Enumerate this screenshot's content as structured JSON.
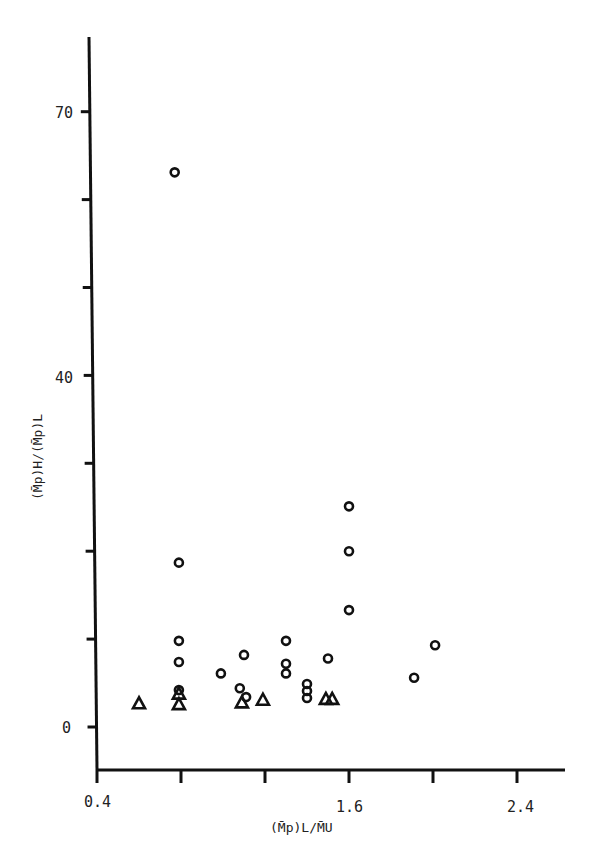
{
  "chart_data": {
    "type": "scatter",
    "title": "",
    "xlabel": "(M̄p)L/M̄U",
    "ylabel": "(M̄p)H/(M̄p)L",
    "xlim": [
      0.4,
      2.6
    ],
    "ylim": [
      -5,
      81
    ],
    "x_ticks": [
      0.4,
      0.8,
      1.2,
      1.6,
      2.0,
      2.4
    ],
    "x_tick_labels": {
      "0.4": "0.4",
      "1.6": "1.6",
      "2.4": "2.4"
    },
    "y_ticks": [
      0,
      10,
      20,
      30,
      40,
      50,
      60,
      70
    ],
    "y_tick_labels": {
      "0": "0",
      "40": "40",
      "70": "70"
    },
    "grid": false,
    "legend": null,
    "series": [
      {
        "name": "circles",
        "marker": "circle",
        "points": [
          [
            0.77,
            63.1
          ],
          [
            0.79,
            18.7
          ],
          [
            0.79,
            9.8
          ],
          [
            0.79,
            7.4
          ],
          [
            0.79,
            4.2
          ],
          [
            0.99,
            6.1
          ],
          [
            1.1,
            8.2
          ],
          [
            1.08,
            4.4
          ],
          [
            1.11,
            3.4
          ],
          [
            1.3,
            9.8
          ],
          [
            1.3,
            7.2
          ],
          [
            1.3,
            6.1
          ],
          [
            1.4,
            4.9
          ],
          [
            1.4,
            4.1
          ],
          [
            1.4,
            3.3
          ],
          [
            1.5,
            7.8
          ],
          [
            1.6,
            25.1
          ],
          [
            1.6,
            20.0
          ],
          [
            1.6,
            13.3
          ],
          [
            1.91,
            5.6
          ],
          [
            2.01,
            9.3
          ]
        ]
      },
      {
        "name": "triangles",
        "marker": "triangle",
        "points": [
          [
            0.6,
            2.7
          ],
          [
            0.79,
            3.8
          ],
          [
            0.79,
            2.6
          ],
          [
            1.09,
            2.8
          ],
          [
            1.19,
            3.1
          ],
          [
            1.49,
            3.2
          ],
          [
            1.52,
            3.2
          ]
        ]
      }
    ]
  },
  "labels": {
    "y_tick_70": "70",
    "y_tick_40": "40",
    "y_tick_0": "0",
    "x_tick_04": "0.4",
    "x_tick_16": "1.6",
    "x_tick_24": "2.4",
    "x_axis_title": "(M̄p)L/M̄U",
    "y_axis_title": "(M̄p)H/(M̄p)L"
  }
}
